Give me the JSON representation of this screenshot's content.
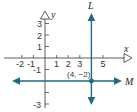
{
  "diagram": {
    "type": "coordinate-plane",
    "axes": {
      "x_label": "x",
      "y_label": "y",
      "x_ticks": [
        "-2",
        "-1",
        "1",
        "2",
        "3",
        "5"
      ],
      "y_ticks": [
        "3",
        "2",
        "1",
        "-1",
        "-3"
      ]
    },
    "lines": [
      {
        "name": "L",
        "label": "L",
        "orientation": "vertical",
        "equation": "x = 4"
      },
      {
        "name": "M",
        "label": "M",
        "orientation": "horizontal",
        "equation": "y = -2"
      }
    ],
    "point": {
      "label": "(4, −2)",
      "x": 4,
      "y": -2
    },
    "colors": {
      "axis": "#333333",
      "line": "#1f6a80",
      "point": "#1f6a80"
    }
  }
}
